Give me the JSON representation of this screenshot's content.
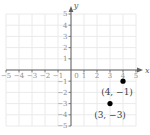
{
  "chart_data": {
    "type": "scatter",
    "xlabel": "x",
    "ylabel": "y",
    "xlim": [
      -5,
      5
    ],
    "ylim": [
      -5,
      5
    ],
    "grid": true,
    "origin_label": "0",
    "x_ticks": [
      {
        "value": -5,
        "label": "−5"
      },
      {
        "value": -4,
        "label": "−4"
      },
      {
        "value": -3,
        "label": "−3"
      },
      {
        "value": -2,
        "label": "−2"
      },
      {
        "value": -1,
        "label": "−1"
      },
      {
        "value": 1,
        "label": "1"
      },
      {
        "value": 2,
        "label": "2"
      },
      {
        "value": 3,
        "label": "3"
      },
      {
        "value": 4,
        "label": "4"
      },
      {
        "value": 5,
        "label": "5"
      }
    ],
    "y_ticks": [
      {
        "value": 5,
        "label": "5"
      },
      {
        "value": 4,
        "label": "4"
      },
      {
        "value": 3,
        "label": "3"
      },
      {
        "value": 2,
        "label": "2"
      },
      {
        "value": 1,
        "label": "1"
      },
      {
        "value": -1,
        "label": "−1"
      },
      {
        "value": -2,
        "label": "−2"
      },
      {
        "value": -3,
        "label": "−3"
      },
      {
        "value": -4,
        "label": "−4"
      },
      {
        "value": -5,
        "label": "−5"
      }
    ],
    "points": [
      {
        "x": 4,
        "y": -1,
        "label": "(4, −1)",
        "label_offset": [
          -6,
          14
        ]
      },
      {
        "x": 3,
        "y": -3,
        "label": "(3, −3)",
        "label_offset": [
          0,
          14
        ]
      }
    ],
    "colors": {
      "background": "#ffffff",
      "grid": "#eaeaea",
      "axis": "#606060",
      "tick_label": "#8f8f8f",
      "point": "#000000",
      "point_label": "#3d3d3d"
    }
  }
}
